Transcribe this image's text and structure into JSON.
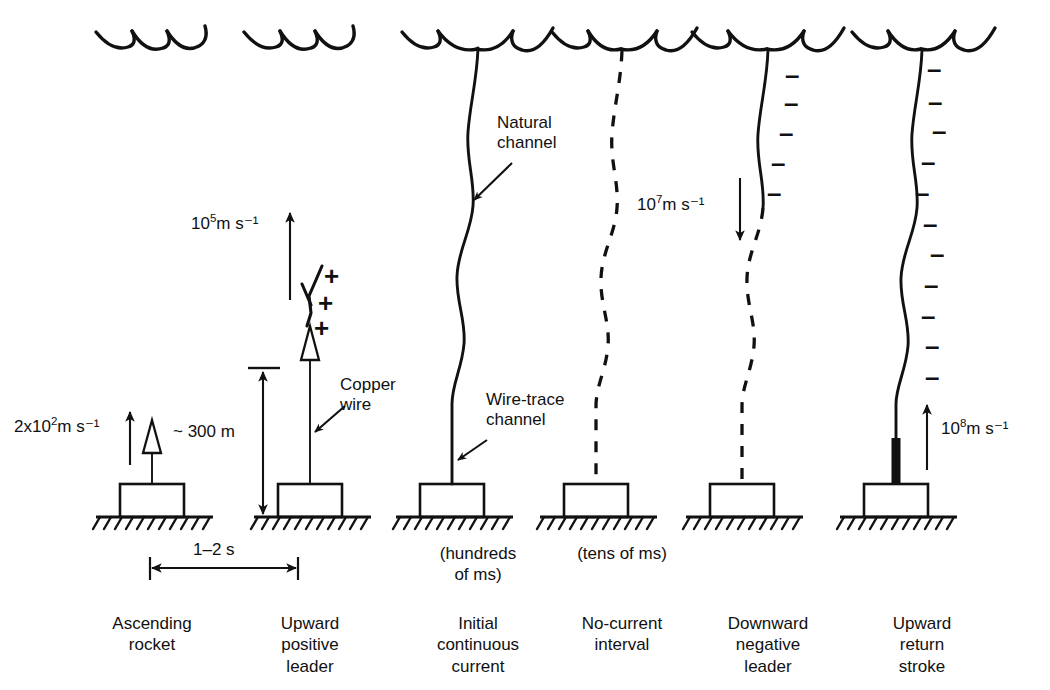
{
  "figure": {
    "background_color": "#ffffff",
    "ink_color": "#111111",
    "width": 1050,
    "height": 690
  },
  "panels": [
    {
      "id": "ascending-rocket",
      "index": 1,
      "caption": "Ascending\nrocket",
      "caption_lines": [
        "Ascending",
        "rocket"
      ],
      "center_x": 152,
      "has_cloud": true,
      "channel_type": "none",
      "velocity_label": "2x10² m s⁻¹",
      "velocity_mantissa": "2x10",
      "velocity_exponent": "2",
      "velocity_unit": "m s⁻¹",
      "velocity_arrow_direction": "up",
      "rocket_visible": true,
      "duration_note": ""
    },
    {
      "id": "upward-positive-leader",
      "index": 2,
      "caption": "Upward\npositive\nleader",
      "caption_lines": [
        "Upward",
        "positive",
        "leader"
      ],
      "center_x": 310,
      "has_cloud": true,
      "channel_type": "wire-with-leader",
      "velocity_label": "10⁵ m s⁻¹",
      "velocity_mantissa": "10",
      "velocity_exponent": "5",
      "velocity_unit": "m s⁻¹",
      "velocity_arrow_direction": "up",
      "rocket_visible": true,
      "charge_signs": [
        "+",
        "+",
        "+"
      ],
      "annotation": "Copper\nwire",
      "annotation_lines": [
        "Copper",
        "wire"
      ],
      "height_label": "~ 300 m",
      "duration_note": ""
    },
    {
      "id": "initial-continuous-current",
      "index": 3,
      "caption": "Initial\ncontinuous\ncurrent",
      "caption_lines": [
        "Initial",
        "continuous",
        "current"
      ],
      "center_x": 478,
      "has_cloud": true,
      "channel_type": "solid-wavy",
      "annotation_top": "Natural\nchannel",
      "annotation_top_lines": [
        "Natural",
        "channel"
      ],
      "annotation_bottom": "Wire-trace\nchannel",
      "annotation_bottom_lines": [
        "Wire-trace",
        "channel"
      ],
      "duration_note": "(hundreds\nof ms)",
      "duration_note_lines": [
        "(hundreds",
        "of ms)"
      ]
    },
    {
      "id": "no-current-interval",
      "index": 4,
      "caption": "No-current\ninterval",
      "caption_lines": [
        "No-current",
        "interval"
      ],
      "center_x": 622,
      "has_cloud": true,
      "channel_type": "dashed",
      "duration_note": "(tens of ms)",
      "duration_note_lines": [
        "(tens of ms)"
      ]
    },
    {
      "id": "downward-negative-leader",
      "index": 5,
      "caption": "Downward\nnegative\nleader",
      "caption_lines": [
        "Downward",
        "negative",
        "leader"
      ],
      "center_x": 768,
      "has_cloud": true,
      "channel_type": "solid-top-dashed-bottom",
      "velocity_label": "10⁷ m s⁻¹",
      "velocity_mantissa": "10",
      "velocity_exponent": "7",
      "velocity_unit": "m s⁻¹",
      "velocity_arrow_direction": "down",
      "charge_signs": [
        "–",
        "–",
        "–",
        "–",
        "–"
      ],
      "duration_note": ""
    },
    {
      "id": "upward-return-stroke",
      "index": 6,
      "caption": "Upward\nreturn\nstroke",
      "caption_lines": [
        "Upward",
        "return",
        "stroke"
      ],
      "center_x": 922,
      "has_cloud": true,
      "channel_type": "solid-wavy-with-bright-base",
      "velocity_label": "10⁸ m s⁻¹",
      "velocity_mantissa": "10",
      "velocity_exponent": "8",
      "velocity_unit": "m s⁻¹",
      "velocity_arrow_direction": "up",
      "charge_signs": [
        "–",
        "–",
        "–",
        "–",
        "–",
        "–",
        "–",
        "–",
        "–",
        "–",
        "–"
      ],
      "duration_note": ""
    }
  ],
  "measurements": {
    "rocket_height": "~ 300 m",
    "interval_between_panels": "1–2 s"
  },
  "annotations": {
    "copper_wire": "Copper\nwire",
    "natural_channel": "Natural\nchannel",
    "wire_trace_channel": "Wire-trace\nchannel"
  }
}
